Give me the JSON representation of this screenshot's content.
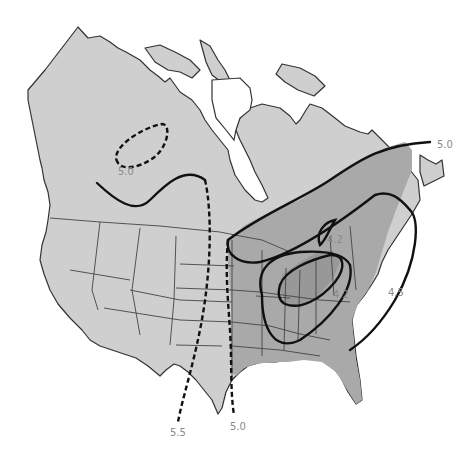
{
  "map": {
    "title": "",
    "region": "North America (Canada and United States)",
    "colors": {
      "land": "#cfcfcf",
      "shaded_zone": "#a9a9a9",
      "inner_zone": "#989898",
      "isoline": "#111111",
      "label": "#8a8a8a"
    },
    "isolines": [
      {
        "id": "canada-dashed-loop",
        "value": "5.0",
        "style": "dashed"
      },
      {
        "id": "northeast-band-top",
        "value": "5.0",
        "style": "solid"
      },
      {
        "id": "great-lakes-loop",
        "value": "4.2",
        "style": "solid"
      },
      {
        "id": "appalachian-loop",
        "value": "4.2",
        "style": "solid"
      },
      {
        "id": "east-coast",
        "value": "4.5",
        "style": "solid"
      },
      {
        "id": "plains-west-dashed",
        "value": "5.5",
        "style": "dashed"
      },
      {
        "id": "plains-east-dashed",
        "value": "5.0",
        "style": "dashed"
      }
    ],
    "labels": {
      "l1": "5.0",
      "l2": "5.0",
      "l3": "4.2",
      "l4": "4.2",
      "l5": "4.5",
      "l6": "5.5",
      "l7": "5.0"
    }
  }
}
